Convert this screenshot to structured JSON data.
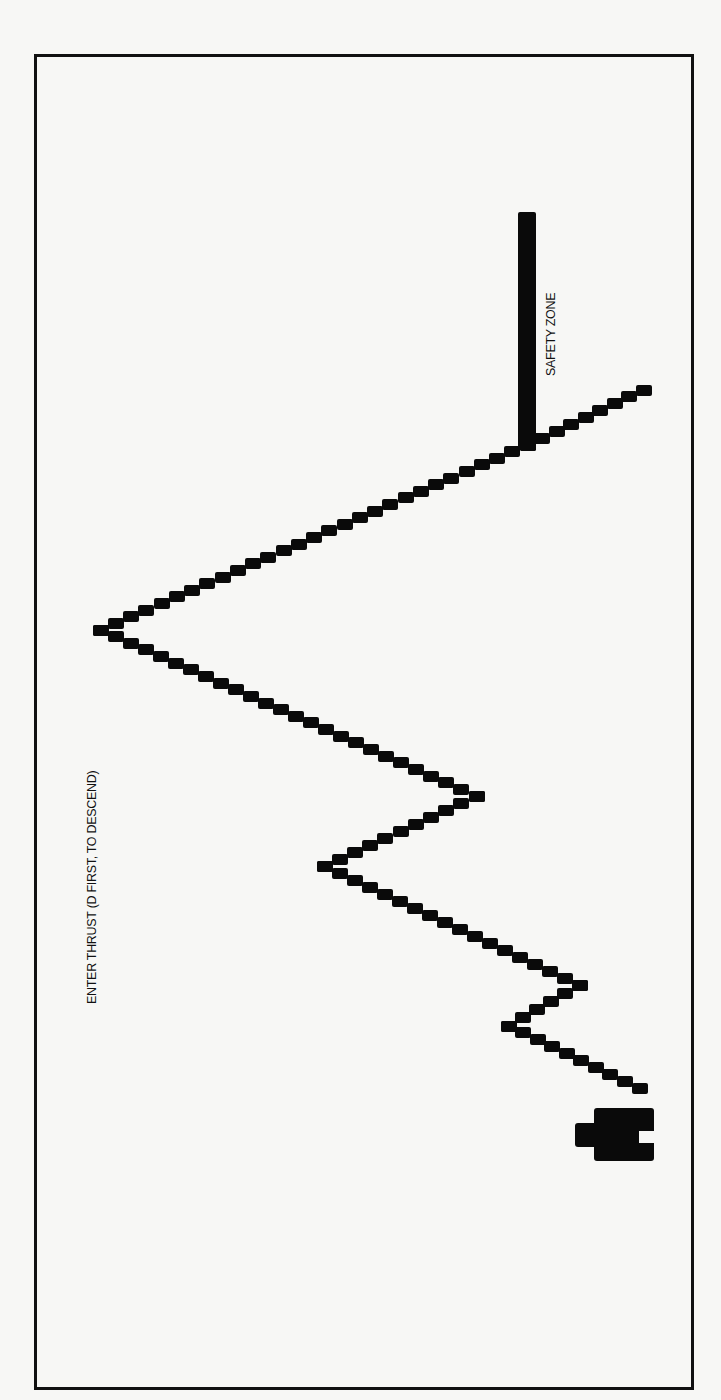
{
  "game": {
    "title": "Lunar descent terrain screen",
    "labels": {
      "safety_zone": "SAFETY ZONE",
      "prompt": "ENTER THRUST (D FIRST, TO DESCEND)"
    },
    "colors": {
      "background": "#f7f7f5",
      "ink": "#0a0a0a"
    },
    "terrain": {
      "step_width": 15,
      "step_height": 11,
      "vertices": [
        {
          "x": 639,
          "y": 1088
        },
        {
          "x": 508,
          "y": 1026
        },
        {
          "x": 579,
          "y": 985
        },
        {
          "x": 324,
          "y": 866
        },
        {
          "x": 476,
          "y": 796
        },
        {
          "x": 100,
          "y": 630
        },
        {
          "x": 527,
          "y": 445
        },
        {
          "x": 643,
          "y": 390
        }
      ]
    },
    "safety_zone": {
      "x": 518,
      "top": 212,
      "bottom": 450
    },
    "lander": {
      "x": 575,
      "y": 1108
    }
  }
}
